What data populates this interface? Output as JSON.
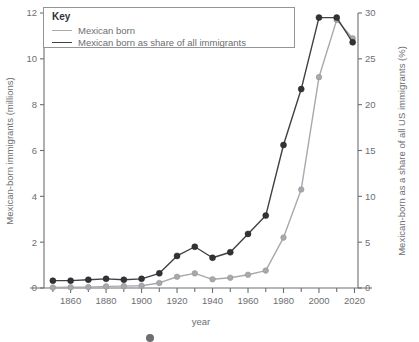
{
  "chart_data": {
    "type": "line",
    "title": "",
    "xlabel": "year",
    "ylabel": "Mexican-born immigrants (millions)",
    "y2label": "Mexican-born as a share of all US immigrants (%)",
    "xlim": [
      1845,
      2022
    ],
    "ylim": [
      0,
      12
    ],
    "y2lim": [
      0,
      30
    ],
    "grid": false,
    "legend_position": "top-left",
    "legend_title": "Key",
    "x_ticks": [
      1860,
      1880,
      1900,
      1920,
      1940,
      1960,
      1980,
      2000,
      2020
    ],
    "x_minor_ticks": [
      1850,
      1870,
      1890,
      1910,
      1930,
      1950,
      1970,
      1990,
      2010
    ],
    "y_ticks": [
      0,
      2,
      4,
      6,
      8,
      10,
      12
    ],
    "y2_ticks": [
      0,
      5,
      10,
      15,
      20,
      25,
      30
    ],
    "x": [
      1850,
      1860,
      1870,
      1880,
      1890,
      1900,
      1910,
      1920,
      1930,
      1940,
      1950,
      1960,
      1970,
      1980,
      1990,
      2000,
      2010,
      2019
    ],
    "series": [
      {
        "name": "Mexican born",
        "axis": "left",
        "unit": "millions",
        "color": "#a8a9ad",
        "values": [
          0.02,
          0.03,
          0.04,
          0.07,
          0.08,
          0.1,
          0.22,
          0.49,
          0.64,
          0.38,
          0.45,
          0.58,
          0.76,
          2.2,
          4.3,
          9.2,
          11.7,
          10.9
        ]
      },
      {
        "name": "Mexican born as share of all immigrants",
        "axis": "right",
        "unit": "percent",
        "color": "#414042",
        "values": [
          0.8,
          0.8,
          0.9,
          1.0,
          0.9,
          1.0,
          1.6,
          3.5,
          4.5,
          3.3,
          3.9,
          5.9,
          7.9,
          15.6,
          21.7,
          29.5,
          29.5,
          26.8
        ]
      }
    ]
  },
  "legend": {
    "title": "Key",
    "entries": [
      {
        "label": "Mexican born",
        "style": "light"
      },
      {
        "label": "Mexican born as share of all immigrants",
        "style": "dark"
      }
    ]
  },
  "axes": {
    "left_title": "Mexican-born immigrants (millions)",
    "right_title": "Mexican-born as a share of all US immigrants (%)",
    "bottom_title": "year"
  },
  "colors": {
    "light_series": "#a8a9ad",
    "dark_series": "#414042",
    "axis": "#6d6e71",
    "text": "#6d6e71",
    "background": "#ffffff"
  }
}
